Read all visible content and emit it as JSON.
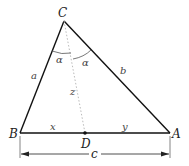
{
  "diagram": {
    "vertices": {
      "A": {
        "label": "A",
        "x": 170,
        "y": 133
      },
      "B": {
        "label": "B",
        "x": 20,
        "y": 133
      },
      "C": {
        "label": "C",
        "x": 64,
        "y": 21
      },
      "D": {
        "label": "D",
        "x": 85,
        "y": 133
      }
    },
    "sides": {
      "a": "a",
      "b": "b",
      "c": "c"
    },
    "segments": {
      "x": "x",
      "y": "y",
      "z": "z"
    },
    "angles": {
      "left": "α",
      "right": "α"
    },
    "colors": {
      "stroke": "#111111",
      "bisector": "#bbbbbb",
      "text": "#222222"
    }
  }
}
